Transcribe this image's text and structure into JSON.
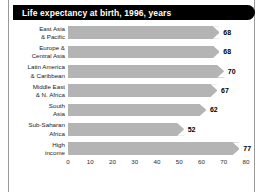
{
  "header": {
    "title": "Life expectancy at birth, 1996, years",
    "bar_color": "#000000",
    "text_color": "#ffffff"
  },
  "chart_data": {
    "type": "bar",
    "orientation": "horizontal",
    "title": "Life expectancy at birth, 1996, years",
    "xlabel": "",
    "ylabel": "",
    "xlim": [
      0,
      80
    ],
    "grid": false,
    "legend": "none",
    "bar_color": "#b4b4b4",
    "categories": [
      "East Asia & Pacific",
      "Europe & Central Asia",
      "Latin America & Caribbean",
      "Middle East & N. Africa",
      "South Asia",
      "Sub-Saharan Africa",
      "High income"
    ],
    "category_lines": [
      [
        "East Asia",
        "& Pacific"
      ],
      [
        "Europe &",
        "Central Asia"
      ],
      [
        "Latin America",
        "& Caribbean"
      ],
      [
        "Middle East",
        "& N. Africa"
      ],
      [
        "South",
        "Asia"
      ],
      [
        "Sub-Saharan",
        "Africa"
      ],
      [
        "High",
        "income"
      ]
    ],
    "values": [
      68,
      68,
      70,
      67,
      62,
      52,
      77
    ],
    "value_labels": [
      "68",
      "68",
      "70",
      "67",
      "62",
      "52",
      "77"
    ],
    "xticks": [
      0,
      10,
      20,
      30,
      40,
      50,
      60,
      70,
      80
    ],
    "xtick_labels": [
      "0",
      "10",
      "20",
      "30",
      "40",
      "50",
      "60",
      "70",
      "80"
    ]
  }
}
